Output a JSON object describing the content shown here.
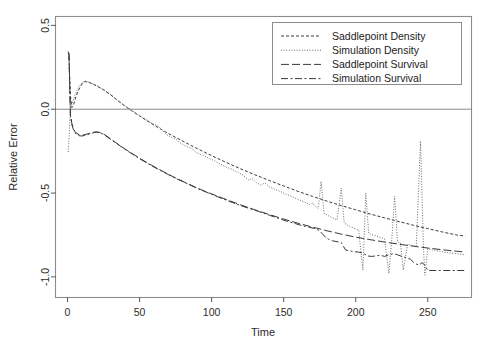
{
  "chart_data": {
    "type": "line",
    "title": "",
    "xlabel": "Time",
    "ylabel": "Relative Error",
    "xlim": [
      -8,
      280
    ],
    "ylim": [
      -1.12,
      0.55
    ],
    "xticks": [
      0,
      50,
      100,
      150,
      200,
      250
    ],
    "xtick_labels": [
      "0",
      "50",
      "100",
      "150",
      "200",
      "250"
    ],
    "yticks": [
      0.5,
      0.0,
      -0.5,
      -1.0
    ],
    "ytick_labels": [
      "0.5",
      "0.0",
      "-0.5",
      "-1.0"
    ],
    "grid": false,
    "reference_lines": [
      {
        "axis": "y",
        "value": 0.0,
        "color": "#8c8c8c"
      }
    ],
    "legend_position": "top-right",
    "legend": [
      {
        "label": "Saddlepoint Density",
        "dash": "3,2",
        "color": "#3a3a3a"
      },
      {
        "label": "Simulation Density",
        "dash": "1,1.6",
        "color": "#6b6b6b"
      },
      {
        "label": "Saddlepoint Survival",
        "dash": "8,3",
        "color": "#3a3a3a"
      },
      {
        "label": "Simulation Survival",
        "dash": "7,2.5,2,2.5",
        "color": "#3a3a3a"
      }
    ],
    "series": [
      {
        "name": "Saddlepoint Density",
        "dash": "3,2",
        "color": "#3a3a3a",
        "x": [
          0.5,
          1,
          2,
          3,
          4,
          5,
          6,
          8,
          10,
          12,
          15,
          18,
          20,
          25,
          30,
          35,
          40,
          45,
          50,
          55,
          60,
          65,
          70,
          75,
          80,
          85,
          90,
          95,
          100,
          110,
          120,
          130,
          140,
          150,
          160,
          170,
          180,
          190,
          200,
          210,
          220,
          230,
          240,
          250,
          260,
          270,
          276
        ],
        "y": [
          0.345,
          0.3,
          0.08,
          0.01,
          0.02,
          0.05,
          0.08,
          0.12,
          0.15,
          0.165,
          0.16,
          0.148,
          0.14,
          0.115,
          0.085,
          0.05,
          0.018,
          -0.012,
          -0.04,
          -0.068,
          -0.095,
          -0.12,
          -0.145,
          -0.168,
          -0.19,
          -0.213,
          -0.235,
          -0.256,
          -0.277,
          -0.317,
          -0.355,
          -0.391,
          -0.425,
          -0.458,
          -0.49,
          -0.52,
          -0.548,
          -0.575,
          -0.6,
          -0.625,
          -0.648,
          -0.67,
          -0.692,
          -0.712,
          -0.732,
          -0.75,
          -0.757
        ]
      },
      {
        "name": "Simulation Density",
        "dash": "1,1.6",
        "color": "#6b6b6b",
        "x": [
          0.5,
          1,
          2,
          3,
          4,
          5,
          6,
          8,
          10,
          12,
          15,
          18,
          20,
          25,
          30,
          35,
          40,
          45,
          50,
          55,
          60,
          63,
          66,
          69,
          72,
          75,
          78,
          82,
          86,
          90,
          94,
          98,
          102,
          106,
          110,
          114,
          118,
          122,
          126,
          128,
          131,
          134,
          137,
          140,
          144,
          148,
          152,
          156,
          160,
          164,
          168,
          170,
          172,
          174,
          176,
          178,
          181,
          184,
          187,
          190,
          192,
          194,
          196,
          199,
          202,
          205,
          207,
          209,
          211,
          214,
          217,
          220,
          223,
          225,
          227,
          229,
          231,
          233,
          236,
          239,
          242,
          245,
          247,
          248,
          250,
          253,
          256,
          260,
          265,
          270,
          276
        ],
        "y": [
          -0.255,
          -0.18,
          0.0,
          0.03,
          0.055,
          0.08,
          0.1,
          0.135,
          0.158,
          0.168,
          0.162,
          0.15,
          0.142,
          0.118,
          0.088,
          0.052,
          0.02,
          -0.01,
          -0.038,
          -0.065,
          -0.09,
          -0.1,
          -0.128,
          -0.152,
          -0.168,
          -0.178,
          -0.2,
          -0.22,
          -0.232,
          -0.262,
          -0.275,
          -0.292,
          -0.308,
          -0.328,
          -0.345,
          -0.358,
          -0.375,
          -0.395,
          -0.425,
          -0.412,
          -0.438,
          -0.452,
          -0.44,
          -0.462,
          -0.478,
          -0.492,
          -0.508,
          -0.522,
          -0.538,
          -0.552,
          -0.568,
          -0.56,
          -0.578,
          -0.592,
          -0.43,
          -0.62,
          -0.635,
          -0.648,
          -0.66,
          -0.47,
          -0.678,
          -0.69,
          -0.7,
          -0.71,
          -0.72,
          -0.96,
          -0.5,
          -0.74,
          -0.748,
          -0.755,
          -0.765,
          -0.772,
          -0.98,
          -0.78,
          -0.52,
          -0.79,
          -0.798,
          -0.96,
          -0.805,
          -0.812,
          -0.818,
          -0.19,
          -0.826,
          -0.99,
          -0.832,
          -0.838,
          -0.843,
          -0.85,
          -0.857,
          -0.862,
          -0.868
        ]
      },
      {
        "name": "Saddlepoint Survival",
        "dash": "8,3",
        "color": "#3a3a3a",
        "x": [
          1,
          2,
          3,
          4,
          5,
          6,
          8,
          10,
          12,
          15,
          18,
          20,
          22,
          25,
          28,
          30,
          35,
          40,
          45,
          50,
          55,
          60,
          65,
          70,
          75,
          80,
          85,
          90,
          95,
          100,
          110,
          120,
          130,
          140,
          150,
          160,
          170,
          180,
          190,
          200,
          210,
          220,
          230,
          240,
          250,
          260,
          270,
          276
        ],
        "y": [
          0.335,
          -0.03,
          -0.085,
          -0.115,
          -0.132,
          -0.142,
          -0.152,
          -0.155,
          -0.152,
          -0.145,
          -0.138,
          -0.135,
          -0.137,
          -0.148,
          -0.165,
          -0.178,
          -0.208,
          -0.238,
          -0.265,
          -0.292,
          -0.318,
          -0.342,
          -0.365,
          -0.388,
          -0.41,
          -0.43,
          -0.45,
          -0.47,
          -0.488,
          -0.505,
          -0.538,
          -0.57,
          -0.6,
          -0.628,
          -0.655,
          -0.68,
          -0.703,
          -0.725,
          -0.745,
          -0.763,
          -0.778,
          -0.792,
          -0.805,
          -0.817,
          -0.828,
          -0.838,
          -0.847,
          -0.852
        ]
      },
      {
        "name": "Simulation Survival",
        "dash": "7,2.5,2,2.5",
        "color": "#3a3a3a",
        "x": [
          1,
          2,
          3,
          4,
          5,
          6,
          8,
          10,
          12,
          15,
          18,
          20,
          22,
          25,
          28,
          30,
          35,
          40,
          45,
          50,
          55,
          60,
          65,
          70,
          75,
          80,
          85,
          90,
          95,
          100,
          110,
          120,
          130,
          140,
          150,
          158,
          163,
          168,
          172,
          175,
          178,
          181,
          184,
          187,
          190,
          193,
          196,
          199,
          202,
          205,
          208,
          211,
          214,
          217,
          220,
          223,
          226,
          229,
          232,
          235,
          238,
          241,
          244,
          246,
          248,
          250,
          255,
          262,
          270,
          276
        ],
        "y": [
          0.33,
          -0.035,
          -0.09,
          -0.12,
          -0.138,
          -0.148,
          -0.158,
          -0.16,
          -0.156,
          -0.148,
          -0.14,
          -0.137,
          -0.14,
          -0.15,
          -0.168,
          -0.18,
          -0.21,
          -0.24,
          -0.268,
          -0.295,
          -0.32,
          -0.345,
          -0.368,
          -0.39,
          -0.412,
          -0.432,
          -0.452,
          -0.472,
          -0.49,
          -0.508,
          -0.542,
          -0.575,
          -0.602,
          -0.632,
          -0.662,
          -0.682,
          -0.695,
          -0.705,
          -0.712,
          -0.725,
          -0.755,
          -0.775,
          -0.785,
          -0.79,
          -0.795,
          -0.84,
          -0.845,
          -0.85,
          -0.852,
          -0.858,
          -0.875,
          -0.878,
          -0.875,
          -0.87,
          -0.878,
          -0.868,
          -0.862,
          -0.868,
          -0.878,
          -0.885,
          -0.895,
          -0.92,
          -0.93,
          -0.915,
          -0.93,
          -0.962,
          -0.962,
          -0.962,
          -0.962,
          -0.962
        ]
      }
    ]
  }
}
